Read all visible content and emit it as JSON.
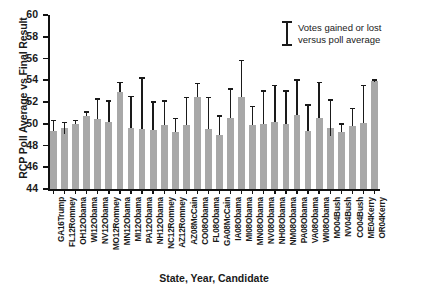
{
  "chart_data": {
    "type": "bar",
    "title": "",
    "xlabel": "State, Year, Candidate",
    "ylabel": "RCP Poll Average vs Final Result",
    "ylim": [
      44,
      60
    ],
    "ytick_step": 2,
    "yticks": [
      44,
      46,
      48,
      50,
      52,
      54,
      56,
      58,
      60
    ],
    "grid": false,
    "bar_color": "#a8a8a8",
    "error_color": "#1a1a1a",
    "legend": {
      "position": "top-right",
      "symbol": "error-bar",
      "line1": "Votes gained or lost",
      "line2": "versus poll average"
    },
    "categories": [
      "GA16Trump",
      "FL12Romney",
      "OH12Obama",
      "WI12Obama",
      "NV12Obama",
      "MO12Romney",
      "MN12Obama",
      "MI12Obama",
      "PA12Obama",
      "NH12Obama",
      "NC12Romney",
      "AZ12Romney",
      "AZ08McCain",
      "CO08Obama",
      "FL08Obama",
      "GA08McCain",
      "IA08Obama",
      "MI08Obama",
      "MN08Obama",
      "NV08Obama",
      "NH08Obama",
      "NM08Obama",
      "PA08Obama",
      "VA08Obama",
      "WI08Obama",
      "MO04Bush",
      "NV04Bush",
      "CO04Bush",
      "ME04Kerry",
      "OR04Kerry"
    ],
    "values": [
      49.3,
      49.6,
      50.0,
      50.7,
      50.4,
      50.2,
      52.9,
      49.6,
      49.5,
      49.4,
      49.9,
      49.2,
      49.9,
      52.5,
      49.5,
      49.0,
      50.5,
      52.5,
      49.9,
      50.0,
      50.2,
      50.0,
      50.8,
      49.3,
      50.5,
      49.6,
      49.2,
      49.8,
      50.1,
      53.9
    ],
    "error_upper": [
      50.3,
      50.1,
      50.3,
      51.1,
      52.3,
      52.1,
      53.8,
      52.5,
      54.2,
      52.0,
      52.1,
      50.5,
      52.4,
      53.7,
      52.4,
      50.7,
      53.2,
      55.8,
      51.6,
      53.0,
      53.5,
      53.0,
      54.0,
      51.7,
      53.8,
      52.2,
      50.0,
      51.4,
      53.5,
      54.0
    ],
    "error_lower": [
      49.3,
      49.1,
      50.0,
      50.7,
      50.4,
      50.2,
      52.9,
      49.6,
      49.5,
      49.4,
      49.9,
      49.2,
      49.9,
      52.5,
      49.5,
      49.0,
      50.5,
      52.5,
      49.9,
      50.0,
      50.2,
      50.0,
      50.8,
      49.3,
      50.5,
      48.9,
      49.2,
      49.8,
      50.1,
      53.8
    ]
  }
}
